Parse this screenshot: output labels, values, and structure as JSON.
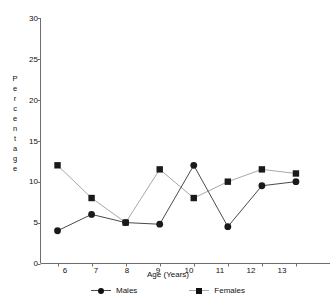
{
  "chart_data": {
    "type": "line",
    "title": "",
    "xlabel": "Age (Years)",
    "ylabel": "Percentage",
    "categories": [
      6,
      7,
      8,
      9,
      10,
      11,
      12,
      13
    ],
    "xlim": [
      5.5,
      14.0
    ],
    "ylim": [
      0,
      30
    ],
    "yticks": [
      0,
      5,
      10,
      15,
      20,
      25,
      30
    ],
    "xticks": [
      6,
      7,
      8,
      9,
      10,
      11,
      12,
      13
    ],
    "grid": false,
    "legend_position": "bottom-center",
    "series": [
      {
        "name": "Males",
        "marker": "circle",
        "color": "#1a1a1a",
        "line_color": "#4a4a4a",
        "values": [
          4.0,
          6.0,
          5.0,
          4.8,
          12.0,
          4.5,
          9.5,
          10.0
        ]
      },
      {
        "name": "Females",
        "marker": "square",
        "color": "#1a1a1a",
        "line_color": "#a8a8a8",
        "values": [
          12.0,
          8.0,
          5.0,
          11.5,
          8.0,
          10.0,
          11.5,
          11.0
        ]
      }
    ]
  },
  "axis": {
    "y_title_letters": [
      "P",
      "e",
      "r",
      "c",
      "e",
      "n",
      "t",
      "a",
      "g",
      "e"
    ],
    "y_tick_labels": [
      "30",
      "25",
      "20",
      "15",
      "10",
      "5",
      "0"
    ],
    "x_tick_labels": [
      "6",
      "7",
      "8",
      "9",
      "10",
      "11",
      "12",
      "13"
    ],
    "x_title": "Age (Years)"
  },
  "legend": {
    "items": [
      {
        "label": "Males",
        "marker": "circle-marker"
      },
      {
        "label": "Females",
        "marker": "square-marker"
      }
    ]
  },
  "colors": {
    "axis": "#6e6e6e",
    "males_line": "#4a4a4a",
    "females_line": "#a8a8a8",
    "marker": "#1a1a1a",
    "text": "#111111",
    "background": "#ffffff"
  }
}
